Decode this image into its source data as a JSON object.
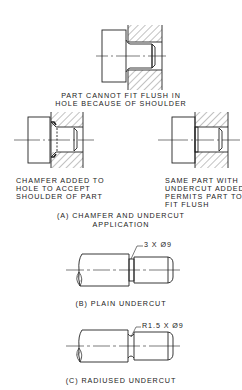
{
  "figure_a": {
    "top_caption_line1": "PART CANNOT FIT FLUSH IN",
    "top_caption_line2": "HOLE BECAUSE OF SHOULDER",
    "left_caption_line1": "CHAMFER ADDED TO",
    "left_caption_line2": "HOLE TO ACCEPT",
    "left_caption_line3": "SHOULDER OF PART",
    "right_caption_line1": "SAME PART WITH",
    "right_caption_line2": "UNDERCUT ADDED",
    "right_caption_line3": "PERMITS PART TO",
    "right_caption_line4": "FIT FLUSH",
    "title_line1": "(A) CHAMFER AND UNDERCUT",
    "title_line2": "APPLICATION"
  },
  "figure_b": {
    "dimension_label": "3 X Ø9",
    "title": "(B) PLAIN UNDERCUT"
  },
  "figure_c": {
    "dimension_label": "R1.5 X Ø9",
    "title": "(C) RADIUSED UNDERCUT"
  },
  "colors": {
    "line": "#222222",
    "background": "#ffffff"
  }
}
